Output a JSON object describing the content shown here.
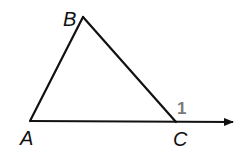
{
  "diagram": {
    "type": "triangle-exterior-angle",
    "vertices": [
      {
        "name": "A",
        "x": 30,
        "y": 121
      },
      {
        "name": "B",
        "x": 83,
        "y": 17
      },
      {
        "name": "C",
        "x": 176,
        "y": 122
      }
    ],
    "labels": {
      "A": "A",
      "B": "B",
      "C": "C",
      "angle": "1"
    },
    "ray": {
      "from": "A",
      "through": "C",
      "to_x": 233,
      "arrow": true
    },
    "colors": {
      "line": "#111111",
      "angle_label": "#7a7a7a"
    }
  }
}
